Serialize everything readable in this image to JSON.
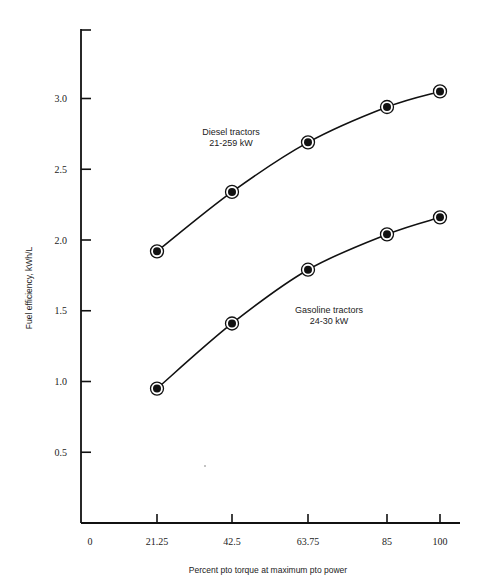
{
  "chart_data": {
    "type": "line",
    "title": "",
    "xlabel": "Percent pto torque at maximum pto power",
    "ylabel": "Fuel efficiency, kWh/L",
    "x": [
      21.25,
      42.5,
      63.75,
      85,
      100
    ],
    "x_ticks": [
      "0",
      "21.25",
      "42.5",
      "63.75",
      "85",
      "100"
    ],
    "x_tick_values": [
      0,
      21.25,
      42.5,
      63.75,
      85,
      100
    ],
    "y_ticks": [
      "0.5",
      "1.0",
      "1.5",
      "2.0",
      "2.5",
      "3.0"
    ],
    "y_tick_values": [
      0.5,
      1.0,
      1.5,
      2.0,
      2.5,
      3.0
    ],
    "xlim": [
      0,
      105
    ],
    "ylim": [
      0,
      3.5
    ],
    "grid": false,
    "legend": "inline labels",
    "series": [
      {
        "name": "Diesel tractors 21-259 kW",
        "label_line1": "Diesel tractors",
        "label_line2": "21-259 kW",
        "values": [
          1.92,
          2.34,
          2.69,
          2.94,
          3.05
        ]
      },
      {
        "name": "Gasoline tractors 24-30 kW",
        "label_line1": "Gasoline tractors",
        "label_line2": "24-30 kW",
        "values": [
          0.95,
          1.41,
          1.79,
          2.04,
          2.16
        ]
      }
    ]
  }
}
